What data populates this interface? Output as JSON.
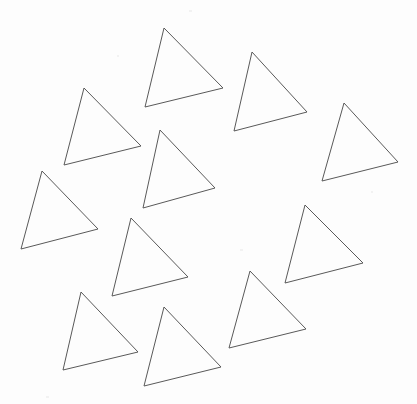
{
  "figure": {
    "description": "Eleven outlined triangles of similar size and orientation scattered in a ring-like arrangement on a blank white page, leaving an empty region near the center.",
    "background_color": "#fdfdfd",
    "stroke_color": "#595959",
    "stroke_width": 1,
    "fill": "none",
    "canvas_width": 417,
    "canvas_height": 404,
    "shape_count": 11,
    "shape_kind": "triangle"
  },
  "chart_data": {
    "type": "scatter",
    "xlabel": "",
    "ylabel": "",
    "xlim": [
      0,
      417
    ],
    "ylim": [
      0,
      404
    ],
    "grid": false,
    "legend": "none",
    "shapes": [
      {
        "id": "triangle-1",
        "label": "top-center",
        "points": "164,28 223,88 145,107",
        "centroid": [
          177,
          74
        ]
      },
      {
        "id": "triangle-2",
        "label": "top-right",
        "points": "252,52 307,112 234,131",
        "centroid": [
          264,
          98
        ]
      },
      {
        "id": "triangle-3",
        "label": "upper-left",
        "points": "84,88 141,146 64,165",
        "centroid": [
          96,
          133
        ]
      },
      {
        "id": "triangle-4",
        "label": "right",
        "points": "344,103 398,162 322,181",
        "centroid": [
          355,
          149
        ]
      },
      {
        "id": "triangle-5",
        "label": "center-upper",
        "points": "160,130 215,188 143,208",
        "centroid": [
          173,
          175
        ]
      },
      {
        "id": "triangle-6",
        "label": "left",
        "points": "42,171 98,229 21,249",
        "centroid": [
          54,
          216
        ]
      },
      {
        "id": "triangle-7",
        "label": "center-lower-left",
        "points": "131,218 188,277 112,296",
        "centroid": [
          144,
          264
        ]
      },
      {
        "id": "triangle-8",
        "label": "right-lower",
        "points": "305,205 363,263 285,283",
        "centroid": [
          318,
          250
        ]
      },
      {
        "id": "triangle-9",
        "label": "bottom-left",
        "points": "81,292 138,352 63,370",
        "centroid": [
          94,
          338
        ]
      },
      {
        "id": "triangle-10",
        "label": "bottom-center",
        "points": "164,307 221,367 144,386",
        "centroid": [
          176,
          353
        ]
      },
      {
        "id": "triangle-11",
        "label": "bottom-right",
        "points": "250,271 306,329 229,348",
        "centroid": [
          262,
          316
        ]
      }
    ]
  },
  "speckles": [
    {
      "x": 46,
      "y": 396,
      "w": 3,
      "h": 2
    },
    {
      "x": 189,
      "y": 10,
      "w": 3,
      "h": 2
    },
    {
      "x": 240,
      "y": 249,
      "w": 3,
      "h": 2
    },
    {
      "x": 117,
      "y": 55,
      "w": 2,
      "h": 2
    },
    {
      "x": 371,
      "y": 191,
      "w": 2,
      "h": 2
    }
  ]
}
